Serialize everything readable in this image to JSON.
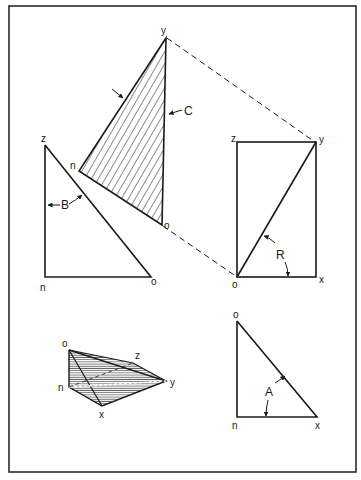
{
  "figure": {
    "frame": {
      "stroke": "#2a2a2a"
    },
    "colors": {
      "ink": "#1a1a1a",
      "paper": "#ffffff",
      "shade": "#9a9a9a"
    },
    "hatched_triangle": {
      "labels": {
        "top": "y",
        "left": "n",
        "bottom": "o"
      },
      "callout": "C"
    },
    "left_triangle": {
      "labels": {
        "top": "z",
        "bottom_left": "n",
        "bottom_right": "o"
      },
      "callout": "B"
    },
    "rectangle_view": {
      "labels": {
        "top_left": "z",
        "top_right": "y",
        "bottom_left": "o",
        "bottom_right": "x"
      },
      "callout": "R"
    },
    "pictorial_solid": {
      "labels": {
        "top": "o",
        "back": "z",
        "left": "n",
        "right": "y",
        "bottom": "x"
      }
    },
    "lower_right_triangle": {
      "labels": {
        "top": "o",
        "bottom_left": "n",
        "bottom_right": "x"
      },
      "callout": "A"
    }
  }
}
